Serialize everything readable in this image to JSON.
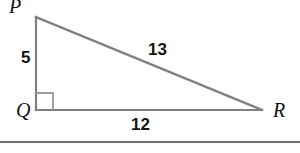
{
  "figure": {
    "type": "right-triangle-diagram",
    "stroke_color": "#808080",
    "label_color": "#141414",
    "background_color": "#ffffff",
    "vertices": [
      {
        "name": "P",
        "label": "P",
        "x": 36,
        "y": 17
      },
      {
        "name": "Q",
        "label": "Q",
        "x": 36,
        "y": 110
      },
      {
        "name": "R",
        "label": "R",
        "x": 262,
        "y": 110
      }
    ],
    "sides": [
      {
        "name": "PQ",
        "label": "5",
        "from": "P",
        "to": "Q"
      },
      {
        "name": "PR",
        "label": "13",
        "from": "P",
        "to": "R"
      },
      {
        "name": "QR",
        "label": "12",
        "from": "Q",
        "to": "R"
      }
    ],
    "right_angle": {
      "at": "Q",
      "marker": "square"
    },
    "separator": {
      "name": "bottom-rule",
      "y": 142
    }
  }
}
